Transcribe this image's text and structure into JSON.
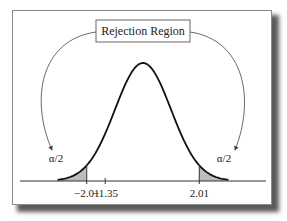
{
  "title_box": "Rejection Region",
  "tail_left_label": "α/2",
  "tail_right_label": "α/2",
  "axis_ticks": [
    {
      "value": -2.01,
      "label": "−2.01"
    },
    {
      "value": -1.35,
      "label": "−1.35"
    },
    {
      "value": 2.01,
      "label": "2.01"
    }
  ],
  "critical_values": [
    -2.01,
    2.01
  ],
  "test_statistic": -1.35,
  "colors": {
    "curve": "#111111",
    "shade": "#bdbdbd",
    "arrow": "#444444"
  }
}
